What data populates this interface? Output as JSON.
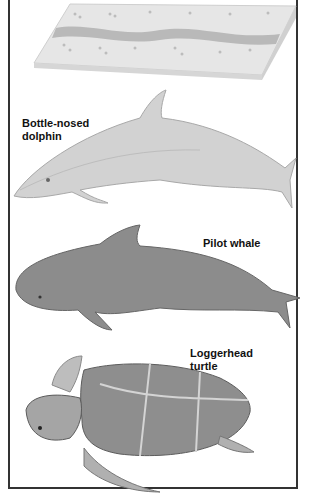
{
  "figure": {
    "panels": [
      {
        "name": "sediment-slab",
        "label": ""
      },
      {
        "name": "bottle-nosed-dolphin",
        "label_line1": "Bottle-nosed",
        "label_line2": "dolphin"
      },
      {
        "name": "pilot-whale",
        "label_line1": "Pilot whale"
      },
      {
        "name": "loggerhead-turtle",
        "label_line1": "Loggerhead",
        "label_line2": "turtle"
      }
    ],
    "colors": {
      "frame": "#333333",
      "slab": "#e4e4e4",
      "band": "#b8b8b8",
      "dolphin": "#cfcfcf",
      "whale": "#8a8a8a",
      "turtle_shell": "#8e8e8e",
      "turtle_skin": "#bdbdbd"
    }
  }
}
